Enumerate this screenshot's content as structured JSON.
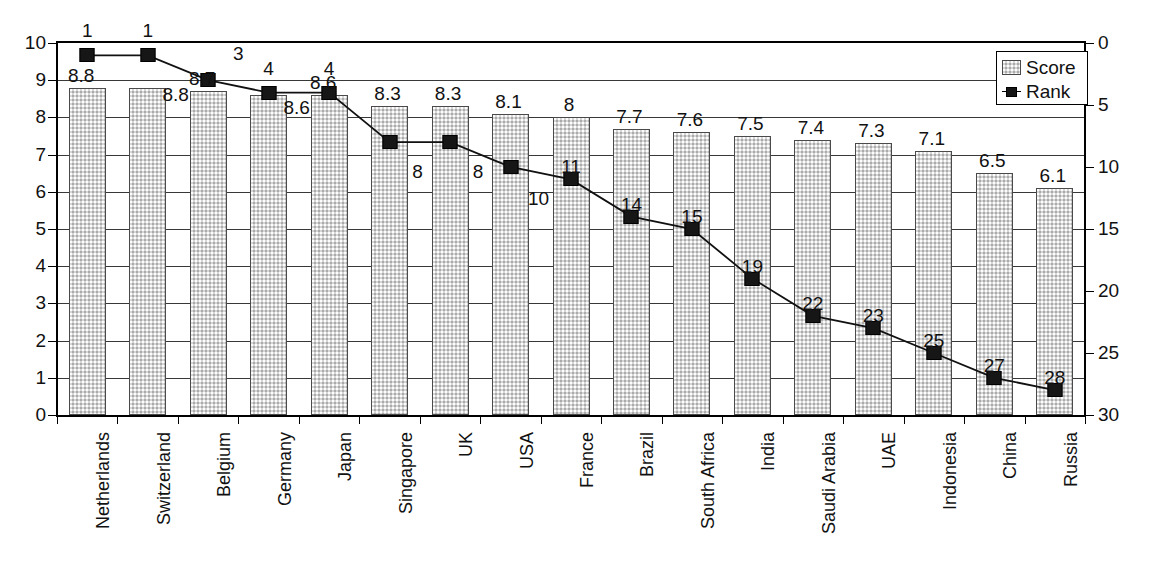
{
  "chart_data": {
    "type": "bar",
    "title": "",
    "subtitle": "",
    "xlabel": "",
    "ylabel": "",
    "categories": [
      "Netherlands",
      "Switzerland",
      "Belgium",
      "Germany",
      "Japan",
      "Singapore",
      "UK",
      "USA",
      "France",
      "Brazil",
      "South Africa",
      "India",
      "Saudi Arabia",
      "UAE",
      "Indonesia",
      "China",
      "Russia"
    ],
    "series": [
      {
        "name": "Score",
        "type": "bar",
        "axis": "left",
        "values": [
          8.8,
          8.8,
          8.7,
          8.6,
          8.6,
          8.3,
          8.3,
          8.1,
          8,
          7.7,
          7.6,
          7.5,
          7.4,
          7.3,
          7.1,
          6.5,
          6.1
        ],
        "labels": [
          "8.8",
          "8.8",
          "8.7",
          "8.6",
          "8.6",
          "8.3",
          "8.3",
          "8.1",
          "8",
          "7.7",
          "7.6",
          "7.5",
          "7.4",
          "7.3",
          "7.1",
          "6.5",
          "6.1"
        ]
      },
      {
        "name": "Rank",
        "type": "line",
        "axis": "right",
        "values": [
          1,
          1,
          3,
          4,
          4,
          8,
          8,
          10,
          11,
          14,
          15,
          19,
          22,
          23,
          25,
          27,
          28
        ],
        "labels": [
          "1",
          "1",
          "3",
          "4",
          "4",
          "8",
          "8",
          "10",
          "11",
          "14",
          "15",
          "19",
          "22",
          "23",
          "25",
          "27",
          "28"
        ]
      }
    ],
    "left_axis": {
      "min": 0,
      "max": 10,
      "step": 1,
      "ticks": [
        "0",
        "1",
        "2",
        "3",
        "4",
        "5",
        "6",
        "7",
        "8",
        "9",
        "10"
      ],
      "inverted": false
    },
    "right_axis": {
      "min": 0,
      "max": 30,
      "step": 5,
      "ticks": [
        "0",
        "5",
        "10",
        "15",
        "20",
        "25",
        "30"
      ],
      "inverted": true
    },
    "grid": true,
    "legend": {
      "position": "top-right",
      "entries": [
        {
          "label": "Score",
          "marker": "filled-square-swatch"
        },
        {
          "label": "Rank",
          "marker": "line-with-square"
        }
      ]
    }
  }
}
